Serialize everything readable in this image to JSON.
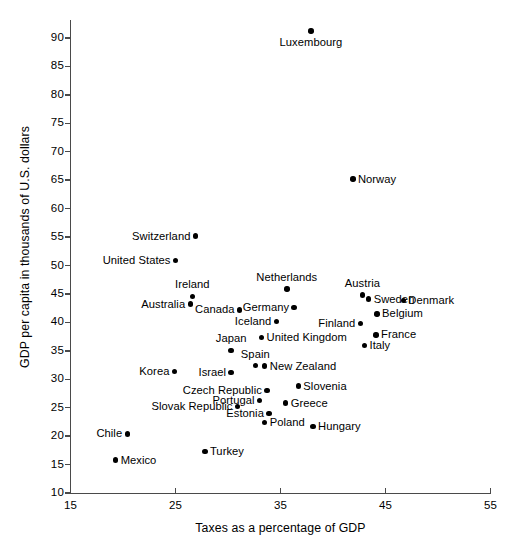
{
  "chart_data": {
    "type": "scatter",
    "title": "",
    "xlabel": "Taxes as a percentage of GDP",
    "ylabel": "GDP per capita in thousands of U.S. dollars",
    "xlim": [
      15,
      55
    ],
    "ylim": [
      10,
      92
    ],
    "xticks": [
      15,
      25,
      35,
      45,
      55
    ],
    "yticks": [
      10,
      15,
      20,
      25,
      30,
      35,
      40,
      45,
      50,
      55,
      60,
      65,
      70,
      75,
      80,
      85,
      90
    ],
    "grid": false,
    "legend": "none",
    "marker_color": "#000000",
    "axis_color": "#4a4a4a",
    "points": [
      {
        "label": "Luxembourg",
        "x": 37.9,
        "y": 91.2,
        "label_pos": "below"
      },
      {
        "label": "Norway",
        "x": 41.9,
        "y": 65.2,
        "label_pos": "right"
      },
      {
        "label": "Switzerland",
        "x": 26.9,
        "y": 55.2,
        "label_pos": "left"
      },
      {
        "label": "United States",
        "x": 25.0,
        "y": 50.9,
        "label_pos": "left"
      },
      {
        "label": "Netherlands",
        "x": 35.6,
        "y": 45.9,
        "label_pos": "above"
      },
      {
        "label": "Austria",
        "x": 42.8,
        "y": 44.8,
        "label_pos": "above"
      },
      {
        "label": "Ireland",
        "x": 26.6,
        "y": 44.6,
        "label_pos": "above"
      },
      {
        "label": "Australia",
        "x": 26.4,
        "y": 43.2,
        "label_pos": "left"
      },
      {
        "label": "Sweden",
        "x": 43.4,
        "y": 44.1,
        "label_pos": "right"
      },
      {
        "label": "Denmark",
        "x": 46.7,
        "y": 43.9,
        "label_pos": "right"
      },
      {
        "label": "Germany",
        "x": 36.3,
        "y": 42.6,
        "label_pos": "left"
      },
      {
        "label": "Canada",
        "x": 31.1,
        "y": 42.2,
        "label_pos": "left"
      },
      {
        "label": "Belgium",
        "x": 44.2,
        "y": 41.5,
        "label_pos": "right"
      },
      {
        "label": "Iceland",
        "x": 34.6,
        "y": 40.2,
        "label_pos": "left"
      },
      {
        "label": "Finland",
        "x": 42.6,
        "y": 39.8,
        "label_pos": "left"
      },
      {
        "label": "France",
        "x": 44.1,
        "y": 37.8,
        "label_pos": "right"
      },
      {
        "label": "United Kingdom",
        "x": 33.2,
        "y": 37.3,
        "label_pos": "right"
      },
      {
        "label": "Italy",
        "x": 43.0,
        "y": 35.9,
        "label_pos": "right"
      },
      {
        "label": "Japan",
        "x": 30.3,
        "y": 35.1,
        "label_pos": "above"
      },
      {
        "label": "Spain",
        "x": 32.6,
        "y": 32.4,
        "label_pos": "above"
      },
      {
        "label": "New Zealand",
        "x": 33.5,
        "y": 32.3,
        "label_pos": "right"
      },
      {
        "label": "Korea",
        "x": 24.9,
        "y": 31.4,
        "label_pos": "left"
      },
      {
        "label": "Israel",
        "x": 30.3,
        "y": 31.2,
        "label_pos": "left"
      },
      {
        "label": "Slovenia",
        "x": 36.7,
        "y": 28.8,
        "label_pos": "right"
      },
      {
        "label": "Czech Republic",
        "x": 33.7,
        "y": 28.0,
        "label_pos": "left"
      },
      {
        "label": "Portugal",
        "x": 33.0,
        "y": 26.3,
        "label_pos": "left"
      },
      {
        "label": "Greece",
        "x": 35.5,
        "y": 25.8,
        "label_pos": "right"
      },
      {
        "label": "Slovak Republic",
        "x": 30.9,
        "y": 25.2,
        "label_pos": "left"
      },
      {
        "label": "Estonia",
        "x": 33.9,
        "y": 24.0,
        "label_pos": "left"
      },
      {
        "label": "Poland",
        "x": 33.5,
        "y": 22.4,
        "label_pos": "right"
      },
      {
        "label": "Hungary",
        "x": 38.1,
        "y": 21.7,
        "label_pos": "right"
      },
      {
        "label": "Chile",
        "x": 20.4,
        "y": 20.4,
        "label_pos": "left"
      },
      {
        "label": "Turkey",
        "x": 27.8,
        "y": 17.3,
        "label_pos": "right"
      },
      {
        "label": "Mexico",
        "x": 19.3,
        "y": 15.8,
        "label_pos": "right"
      }
    ]
  }
}
